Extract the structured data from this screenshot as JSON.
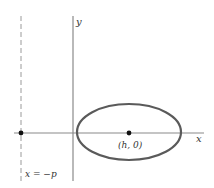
{
  "diagram": {
    "type": "ellipse-with-directrix",
    "colors": {
      "axis": "#8a8a8a",
      "ellipse": "#5a5a5a",
      "directrix": "#9a9a9a",
      "point": "#111111",
      "text": "#333333"
    },
    "axes": {
      "x_label": "x",
      "y_label": "y"
    },
    "ellipse": {
      "center_label": "(h, 0)"
    },
    "directrix": {
      "label": "x = −p"
    }
  }
}
